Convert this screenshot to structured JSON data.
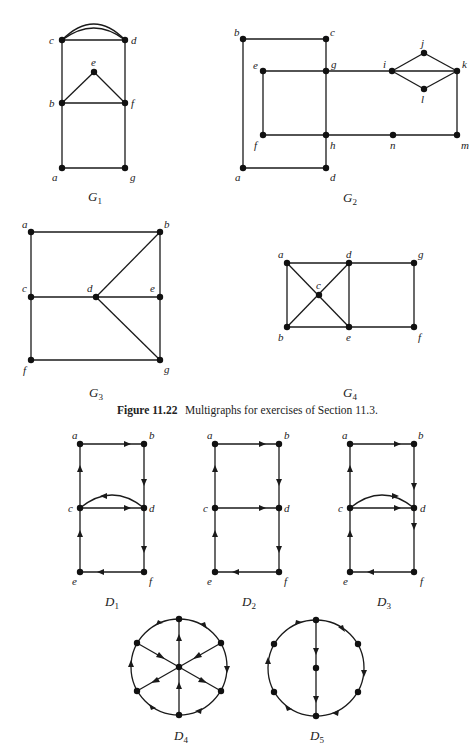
{
  "figure": {
    "caption_number": "Figure 11.22",
    "caption_text": "Multigraphs for exercises of Section 11.3."
  },
  "graphs": {
    "G1": {
      "name": "G",
      "sub": "1",
      "vertices": [
        "a",
        "b",
        "c",
        "d",
        "e",
        "f",
        "g"
      ],
      "edges": [
        [
          "c",
          "d"
        ],
        [
          "c",
          "d"
        ],
        [
          "c",
          "d"
        ],
        [
          "c",
          "b"
        ],
        [
          "d",
          "f"
        ],
        [
          "b",
          "e"
        ],
        [
          "e",
          "f"
        ],
        [
          "b",
          "f"
        ],
        [
          "b",
          "a"
        ],
        [
          "f",
          "g"
        ],
        [
          "a",
          "g"
        ]
      ]
    },
    "G2": {
      "name": "G",
      "sub": "2",
      "vertices": [
        "a",
        "b",
        "c",
        "d",
        "e",
        "f",
        "g",
        "h",
        "i",
        "j",
        "k",
        "l",
        "m",
        "n"
      ],
      "edges": [
        [
          "b",
          "c"
        ],
        [
          "b",
          "a"
        ],
        [
          "a",
          "d"
        ],
        [
          "c",
          "g"
        ],
        [
          "g",
          "h"
        ],
        [
          "h",
          "d"
        ],
        [
          "e",
          "g"
        ],
        [
          "e",
          "f"
        ],
        [
          "f",
          "h"
        ],
        [
          "g",
          "i"
        ],
        [
          "i",
          "j"
        ],
        [
          "j",
          "k"
        ],
        [
          "i",
          "k"
        ],
        [
          "i",
          "l"
        ],
        [
          "l",
          "k"
        ],
        [
          "k",
          "m"
        ],
        [
          "h",
          "n"
        ],
        [
          "n",
          "m"
        ]
      ]
    },
    "G3": {
      "name": "G",
      "sub": "3",
      "vertices": [
        "a",
        "b",
        "c",
        "d",
        "e",
        "f",
        "g"
      ],
      "edges": [
        [
          "a",
          "b"
        ],
        [
          "a",
          "c"
        ],
        [
          "c",
          "f"
        ],
        [
          "c",
          "d"
        ],
        [
          "d",
          "e"
        ],
        [
          "d",
          "b"
        ],
        [
          "d",
          "g"
        ],
        [
          "b",
          "e"
        ],
        [
          "e",
          "g"
        ],
        [
          "f",
          "g"
        ]
      ]
    },
    "G4": {
      "name": "G",
      "sub": "4",
      "vertices": [
        "a",
        "b",
        "c",
        "d",
        "e",
        "f",
        "g"
      ],
      "edges": [
        [
          "a",
          "d"
        ],
        [
          "a",
          "b"
        ],
        [
          "a",
          "c"
        ],
        [
          "c",
          "e"
        ],
        [
          "b",
          "c"
        ],
        [
          "c",
          "d"
        ],
        [
          "d",
          "e"
        ],
        [
          "b",
          "e"
        ],
        [
          "d",
          "g"
        ],
        [
          "g",
          "f"
        ],
        [
          "e",
          "f"
        ]
      ]
    },
    "D1": {
      "name": "D",
      "sub": "1",
      "vertices": [
        "a",
        "b",
        "c",
        "d",
        "e",
        "f"
      ],
      "arcs": [
        [
          "a",
          "b"
        ],
        [
          "b",
          "d"
        ],
        [
          "c",
          "a"
        ],
        [
          "c",
          "d"
        ],
        [
          "d",
          "c"
        ],
        [
          "d",
          "f"
        ],
        [
          "f",
          "e"
        ],
        [
          "e",
          "c"
        ]
      ]
    },
    "D2": {
      "name": "D",
      "sub": "2",
      "vertices": [
        "a",
        "b",
        "c",
        "d",
        "e",
        "f"
      ],
      "arcs": [
        [
          "a",
          "b"
        ],
        [
          "b",
          "d"
        ],
        [
          "c",
          "a"
        ],
        [
          "c",
          "d"
        ],
        [
          "d",
          "f"
        ],
        [
          "f",
          "e"
        ],
        [
          "e",
          "c"
        ]
      ]
    },
    "D3": {
      "name": "D",
      "sub": "3",
      "vertices": [
        "a",
        "b",
        "c",
        "d",
        "e",
        "f"
      ],
      "arcs": [
        [
          "a",
          "b"
        ],
        [
          "b",
          "d"
        ],
        [
          "c",
          "a"
        ],
        [
          "c",
          "d"
        ],
        [
          "c",
          "d"
        ],
        [
          "d",
          "f"
        ],
        [
          "f",
          "e"
        ],
        [
          "e",
          "c"
        ]
      ]
    },
    "D4": {
      "name": "D",
      "sub": "4",
      "description": "wheel with 6 rim vertices and hub"
    },
    "D5": {
      "name": "D",
      "sub": "5",
      "description": "cycle of 6 vertices with vertical chord through center vertex"
    }
  },
  "labels": {
    "a": "a",
    "b": "b",
    "c": "c",
    "d": "d",
    "e": "e",
    "f": "f",
    "g": "g",
    "h": "h",
    "i": "i",
    "j": "j",
    "k": "k",
    "l": "l",
    "m": "m",
    "n": "n"
  }
}
